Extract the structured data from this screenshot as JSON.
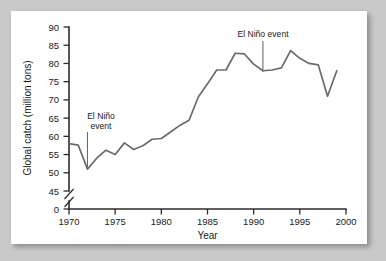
{
  "chart_data": {
    "type": "line",
    "title": "",
    "xlabel": "Year",
    "ylabel": "Global catch (million tons)",
    "xlim": [
      1970,
      2000
    ],
    "ylim": [
      45,
      90
    ],
    "y_axis_zero_tick": "0",
    "y_axis_break": true,
    "grid": false,
    "legend": null,
    "xticks": [
      "1970",
      "1975",
      "1980",
      "1985",
      "1990",
      "1995",
      "2000"
    ],
    "yticks": [
      "0",
      "45",
      "50",
      "55",
      "60",
      "65",
      "70",
      "75",
      "80",
      "85",
      "90"
    ],
    "series": [
      {
        "name": "Global catch",
        "color": "#6b6b6b",
        "x": [
          1970,
          1971,
          1972,
          1973,
          1974,
          1975,
          1976,
          1977,
          1978,
          1979,
          1980,
          1981,
          1982,
          1983,
          1984,
          1985,
          1986,
          1987,
          1988,
          1989,
          1990,
          1991,
          1992,
          1993,
          1994,
          1995,
          1996,
          1997,
          1998,
          1999
        ],
        "values": [
          58.0,
          57.6,
          51.0,
          54.0,
          56.2,
          55.0,
          58.2,
          56.4,
          57.4,
          59.2,
          59.4,
          61.2,
          63.0,
          64.4,
          70.8,
          74.4,
          78.2,
          78.2,
          82.8,
          82.6,
          79.8,
          78.0,
          78.2,
          78.8,
          83.5,
          81.4,
          80.0,
          79.6,
          71.0,
          78.0
        ]
      }
    ],
    "annotations": [
      {
        "name": "el-nino-1972",
        "lines": [
          "El Niño",
          "event"
        ],
        "point_x": 1972,
        "point_y": 51.0,
        "label_x": 1973.4,
        "label_y": 66.0
      },
      {
        "name": "el-nino-1991",
        "lines": [
          "El Niño event"
        ],
        "point_x": 1991,
        "point_y": 78.0,
        "label_x": 1991.0,
        "label_y": 88.5
      }
    ]
  },
  "axis": {
    "y_title": "Global catch (million tons)",
    "x_title": "Year",
    "y_tick_0": "0",
    "y_tick_45": "45",
    "y_tick_50": "50",
    "y_tick_55": "55",
    "y_tick_60": "60",
    "y_tick_65": "65",
    "y_tick_70": "70",
    "y_tick_75": "75",
    "y_tick_80": "80",
    "y_tick_85": "85",
    "y_tick_90": "90",
    "x_tick_1970": "1970",
    "x_tick_1975": "1975",
    "x_tick_1980": "1980",
    "x_tick_1985": "1985",
    "x_tick_1990": "1990",
    "x_tick_1995": "1995",
    "x_tick_2000": "2000"
  },
  "annotation_text": {
    "a1_line1": "El Niño",
    "a1_line2": "event",
    "a2_line1": "El Niño event"
  },
  "colors": {
    "page_background": "#c9c9c9",
    "card_background": "#ffffff",
    "axis": "#2b2b2b",
    "series": "#6b6b6b",
    "text": "#1a1a1a"
  }
}
